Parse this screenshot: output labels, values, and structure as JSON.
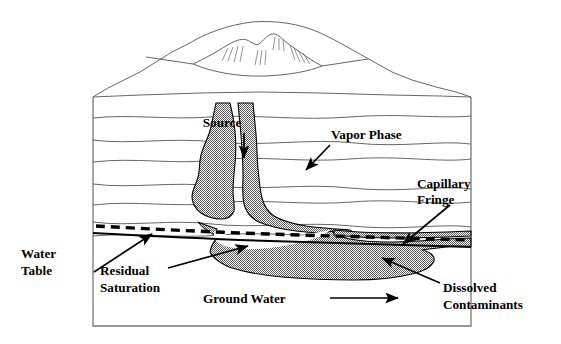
{
  "figure": {
    "kind": "geologic-cross-section",
    "background_color": "#ffffff",
    "ink_color": "#000000",
    "napl_fill_color": "#808080",
    "strata_line_color": "#555555",
    "frame_color": "#777777"
  },
  "labels": {
    "source": "Source",
    "vapor_phase": "Vapor Phase",
    "capillary_fringe_line1": "Capillary",
    "capillary_fringe_line2": "Fringe",
    "water_table_line1": "Water",
    "water_table_line2": "Table",
    "residual_saturation_line1": "Residual",
    "residual_saturation_line2": "Saturation",
    "ground_water": "Ground Water",
    "dissolved_line1": "Dissolved",
    "dissolved_line2": "Contaminants"
  },
  "annotations": [
    {
      "name": "source-arrow",
      "points_to": "release point below source",
      "direction": "down"
    },
    {
      "name": "vapor-phase-arrow",
      "points_to": "shaded vapor plume",
      "direction": "down-left"
    },
    {
      "name": "capillary-fringe-arrow",
      "points_to": "capillary fringe band",
      "direction": "down-left"
    },
    {
      "name": "water-table-arrow",
      "points_to": "water table line",
      "direction": "up-right"
    },
    {
      "name": "residual-saturation-arrow",
      "points_to": "residual saturation pocket",
      "direction": "up-right"
    },
    {
      "name": "ground-water-arrow",
      "points_to": "groundwater flow direction",
      "direction": "right"
    },
    {
      "name": "dissolved-contaminants-arrow",
      "points_to": "dissolved plume",
      "direction": "up-left"
    }
  ],
  "features": {
    "strata_count": 7,
    "water_table_style": "solid line",
    "capillary_fringe_style": "thick dashed line",
    "napl_pattern": "50% dither / stipple gray"
  }
}
